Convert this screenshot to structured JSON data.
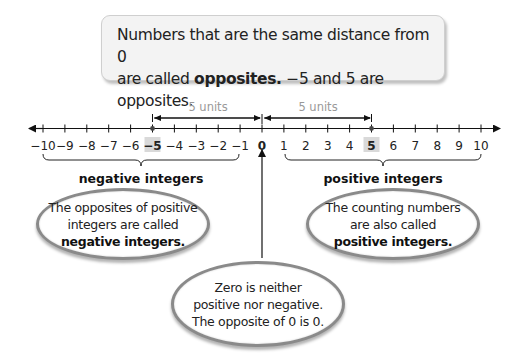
{
  "callout": {
    "line1": "Numbers that are the same distance from 0",
    "line2_pre": "are called ",
    "line2_bold": "opposites.",
    "line2_post": " −5 and 5 are opposites."
  },
  "number_line": {
    "min": -10,
    "max": 10,
    "ticks": [
      "−10",
      "−9",
      "−8",
      "−7",
      "−6",
      "−5",
      "−4",
      "−3",
      "−2",
      "−1",
      "0",
      "1",
      "2",
      "3",
      "4",
      "5",
      "6",
      "7",
      "8",
      "9",
      "10"
    ],
    "highlighted": [
      "−5",
      "0",
      "5"
    ],
    "points": [
      -5,
      5
    ],
    "distance_labels": [
      "5 units",
      "5 units"
    ]
  },
  "groups": {
    "negative_label": "negative integers",
    "positive_label": "positive integers"
  },
  "bubbles": {
    "negative": {
      "line1": "The opposites of positive",
      "line2": "integers are called",
      "bold": "negative integers."
    },
    "positive": {
      "line1": "The counting numbers",
      "line2": "are also called",
      "bold": "positive integers."
    },
    "zero": {
      "line1": "Zero is neither",
      "line2": "positive nor negative.",
      "line3": "The opposite of 0 is 0."
    }
  },
  "colors": {
    "callout_bg": "#f3f3f3",
    "highlight_bg": "#d9d9d9",
    "units_text": "#999999",
    "bubble_border": "#8a8a8a"
  }
}
